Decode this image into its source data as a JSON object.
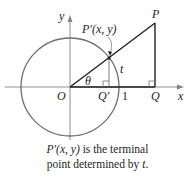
{
  "diagram": {
    "labels": {
      "y_axis": "y",
      "x_axis": "x",
      "origin": "O",
      "point_p": "P",
      "point_p_prime": "P′(x, y)",
      "point_q": "Q",
      "point_q_prime": "Q′",
      "angle": "θ",
      "arc": "t",
      "one": "1"
    },
    "colors": {
      "circle": "#6d6e71",
      "axes": "#808285",
      "lines": "#231f20"
    }
  },
  "caption": {
    "line1_prefix": "P′(x, y)",
    "line1_rest": " is the terminal",
    "line2_prefix": "point determined by ",
    "line2_var": "t",
    "line2_end": "."
  }
}
